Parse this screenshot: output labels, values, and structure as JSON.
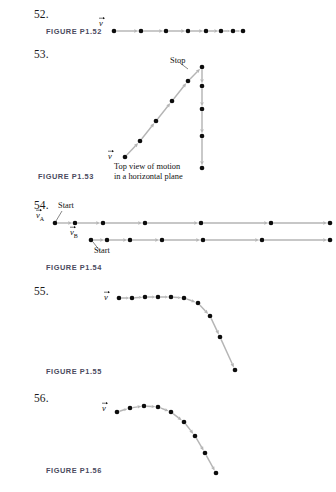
{
  "page": {
    "width": 336,
    "height": 492,
    "background": "#ffffff",
    "dot_color": "#0d0d0d",
    "arrow_color": "#b5b5b5",
    "label_color": "#4a4a5e"
  },
  "problems": [
    {
      "number": "52.",
      "x": 34,
      "y": 8,
      "figure_label": "FIGURE P1.52",
      "figure_label_x": 46,
      "figure_label_y": 27
    },
    {
      "number": "53.",
      "x": 34,
      "y": 48,
      "figure_label": "FIGURE P1.53",
      "figure_label_x": 38,
      "figure_label_y": 172
    },
    {
      "number": "54.",
      "x": 34,
      "y": 199,
      "figure_label": "FIGURE P1.54",
      "figure_label_x": 46,
      "figure_label_y": 263
    },
    {
      "number": "55.",
      "x": 34,
      "y": 285,
      "figure_label": "FIGURE P1.55",
      "figure_label_x": 46,
      "figure_label_y": 367
    },
    {
      "number": "56.",
      "x": 34,
      "y": 392,
      "figure_label": "FIGURE P1.56",
      "figure_label_x": 46,
      "figure_label_y": 466
    }
  ],
  "chart_data": [
    {
      "id": "fig-p1-52",
      "type": "scatter",
      "title": "FIGURE P1.52",
      "description": "Motion diagram: particle moving right with decreasing spacing (slowing down)",
      "origin": {
        "x": 105,
        "y": 22
      },
      "width": 160,
      "height": 18,
      "velocity_label": {
        "text": "v",
        "x": 0,
        "y": 5
      },
      "points": [
        {
          "x": 9,
          "y": 9
        },
        {
          "x": 36,
          "y": 9
        },
        {
          "x": 61,
          "y": 9
        },
        {
          "x": 83,
          "y": 9
        },
        {
          "x": 101,
          "y": 9
        },
        {
          "x": 116,
          "y": 9
        },
        {
          "x": 128,
          "y": 9
        },
        {
          "x": 138,
          "y": 9
        }
      ]
    },
    {
      "id": "fig-p1-53",
      "type": "scatter",
      "title": "FIGURE P1.53",
      "description": "Motion diagram: particle accelerates diagonally up-right to Stop, then travels straight down",
      "origin": {
        "x": 108,
        "y": 58
      },
      "width": 120,
      "height": 125,
      "velocity_label": {
        "text": "v",
        "x": 6,
        "y": 102
      },
      "annotations": [
        {
          "text": "Stop",
          "x": 62,
          "y": -2
        },
        {
          "text": "Top view of motion",
          "x": 6,
          "y": 104
        },
        {
          "text": "in a horizontal plane",
          "x": 6,
          "y": 114
        }
      ],
      "points": [
        {
          "x": 17,
          "y": 99
        },
        {
          "x": 32,
          "y": 83
        },
        {
          "x": 48,
          "y": 63
        },
        {
          "x": 64,
          "y": 43
        },
        {
          "x": 80,
          "y": 23
        },
        {
          "x": 94,
          "y": 9
        },
        {
          "x": 94,
          "y": 28
        },
        {
          "x": 94,
          "y": 51
        },
        {
          "x": 94,
          "y": 78
        },
        {
          "x": 94,
          "y": 110
        }
      ]
    },
    {
      "id": "fig-p1-54-a",
      "type": "scatter",
      "title": "FIGURE P1.54 — object A",
      "description": "Motion diagram A: particle moving right with increasing spacing (speeding up)",
      "origin": {
        "x": 54,
        "y": 215
      },
      "width": 278,
      "height": 16,
      "velocity_label": {
        "text": "v",
        "sub": "A",
        "x": -12,
        "y": 4
      },
      "annotations": [
        {
          "text": "Start",
          "x": 4,
          "y": -14
        }
      ],
      "points": [
        {
          "x": 1,
          "y": 8
        },
        {
          "x": 21,
          "y": 8
        },
        {
          "x": 49,
          "y": 8
        },
        {
          "x": 91,
          "y": 8
        },
        {
          "x": 147,
          "y": 8
        },
        {
          "x": 217,
          "y": 8
        },
        {
          "x": 276,
          "y": 8
        }
      ]
    },
    {
      "id": "fig-p1-54-b",
      "type": "scatter",
      "title": "FIGURE P1.54 — object B",
      "description": "Motion diagram B: particle moving right with increasing spacing (speeding up)",
      "origin": {
        "x": 90,
        "y": 232
      },
      "width": 242,
      "height": 16,
      "velocity_label": {
        "text": "v",
        "sub": "B",
        "x": -14,
        "y": 4
      },
      "annotations": [
        {
          "text": "Start",
          "x": 4,
          "y": 14
        }
      ],
      "points": [
        {
          "x": 1,
          "y": 8
        },
        {
          "x": 17,
          "y": 8
        },
        {
          "x": 40,
          "y": 8
        },
        {
          "x": 72,
          "y": 8
        },
        {
          "x": 113,
          "y": 8
        },
        {
          "x": 172,
          "y": 8
        },
        {
          "x": 240,
          "y": 8
        }
      ]
    },
    {
      "id": "fig-p1-55",
      "type": "scatter",
      "title": "FIGURE P1.55",
      "description": "Motion diagram: particle travels horizontally then curves downward, accelerating (projectile leaving a table)",
      "origin": {
        "x": 110,
        "y": 292
      },
      "width": 140,
      "height": 85,
      "velocity_label": {
        "text": "v",
        "x": 0,
        "y": 9
      },
      "points": [
        {
          "x": 9,
          "y": 6
        },
        {
          "x": 22,
          "y": 6
        },
        {
          "x": 35,
          "y": 5
        },
        {
          "x": 48,
          "y": 5
        },
        {
          "x": 61,
          "y": 5
        },
        {
          "x": 74,
          "y": 6
        },
        {
          "x": 88,
          "y": 11
        },
        {
          "x": 100,
          "y": 24
        },
        {
          "x": 110,
          "y": 45
        },
        {
          "x": 125,
          "y": 78
        }
      ]
    },
    {
      "id": "fig-p1-56",
      "type": "scatter",
      "title": "FIGURE P1.56",
      "description": "Motion diagram: projectile arc rising to a peak then falling with increasing spacing",
      "origin": {
        "x": 108,
        "y": 400
      },
      "width": 130,
      "height": 78,
      "velocity_label": {
        "text": "v",
        "x": 0,
        "y": 12
      },
      "points": [
        {
          "x": 9,
          "y": 12
        },
        {
          "x": 22,
          "y": 8
        },
        {
          "x": 36,
          "y": 6
        },
        {
          "x": 50,
          "y": 7
        },
        {
          "x": 63,
          "y": 12
        },
        {
          "x": 76,
          "y": 22
        },
        {
          "x": 87,
          "y": 36
        },
        {
          "x": 97,
          "y": 53
        },
        {
          "x": 108,
          "y": 73
        }
      ]
    }
  ]
}
